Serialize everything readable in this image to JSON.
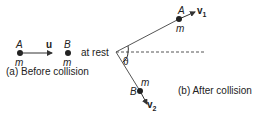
{
  "before": {
    "ball_a_label": "A",
    "ball_a_mass": "m",
    "velocity_label": "u",
    "ball_b_label": "B",
    "ball_b_mass": "m",
    "rest_text": "at rest",
    "caption": "(a) Before collision"
  },
  "after": {
    "ball_a_label": "A",
    "ball_a_mass": "m",
    "v1_label": "v",
    "v1_sub": "1",
    "ball_b_label": "B",
    "ball_b_mass": "m",
    "v2_label": "v",
    "v2_sub": "2",
    "angle_label": "θ",
    "caption": "(b) After collision"
  },
  "colors": {
    "line": "#333333",
    "text": "#222222"
  }
}
